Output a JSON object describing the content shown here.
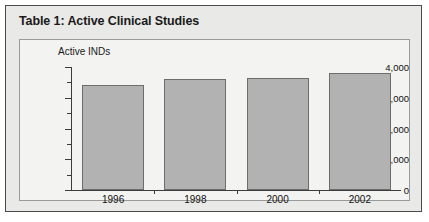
{
  "figure": {
    "title": "Table 1: Active Clinical Studies"
  },
  "chart_data": {
    "type": "bar",
    "title": "Table 1: Active Clinical Studies",
    "axis_note": "Active INDs",
    "xlabel": "",
    "ylabel": "Active INDs",
    "categories": [
      "1996",
      "1998",
      "2000",
      "2002"
    ],
    "values": [
      3400,
      3600,
      3650,
      3820
    ],
    "ylim": [
      0,
      4000
    ],
    "y_ticks": [
      "0",
      "1,000",
      "2,000",
      "3,000",
      "4,000"
    ],
    "y_tick_values": [
      0,
      1000,
      2000,
      3000,
      4000
    ],
    "y_minor_tick_values": [
      500,
      1500,
      2500,
      3500
    ],
    "grid": false,
    "legend": "none",
    "colors": {
      "bar_fill": "#b2b2b2",
      "bar_border": "#6d6d6d",
      "axis": "#3b3b3b",
      "plot_background": "#f3f3f1",
      "card_background": "#e9e9e7",
      "text": "#111111"
    }
  }
}
